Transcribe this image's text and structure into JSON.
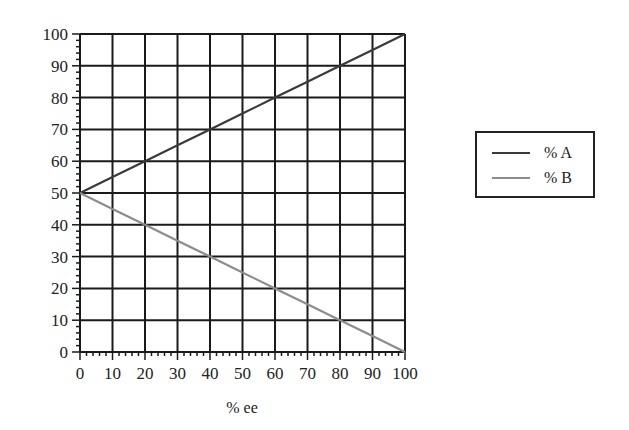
{
  "chart_data": {
    "type": "line",
    "title": "",
    "xlabel": "% ee",
    "ylabel": "",
    "xlim": [
      0,
      100
    ],
    "ylim": [
      0,
      100
    ],
    "x_ticks": [
      0,
      10,
      20,
      30,
      40,
      50,
      60,
      70,
      80,
      90,
      100
    ],
    "y_ticks": [
      0,
      10,
      20,
      30,
      40,
      50,
      60,
      70,
      80,
      90,
      100
    ],
    "minor_ticks_per_major": 5,
    "grid": true,
    "legend_position": "right",
    "x": [
      0,
      10,
      20,
      30,
      40,
      50,
      60,
      70,
      80,
      90,
      100
    ],
    "series": [
      {
        "name": "% A",
        "color": "#3a3a3a",
        "values": [
          50,
          55,
          60,
          65,
          70,
          75,
          80,
          85,
          90,
          95,
          100
        ]
      },
      {
        "name": "% B",
        "color": "#8c8c8c",
        "values": [
          50,
          45,
          40,
          35,
          30,
          25,
          20,
          15,
          10,
          5,
          0
        ]
      }
    ]
  },
  "legend": {
    "items": [
      {
        "label": "% A",
        "color": "#3a3a3a"
      },
      {
        "label": "% B",
        "color": "#8c8c8c"
      }
    ]
  },
  "axes": {
    "xlabel": "% ee"
  }
}
